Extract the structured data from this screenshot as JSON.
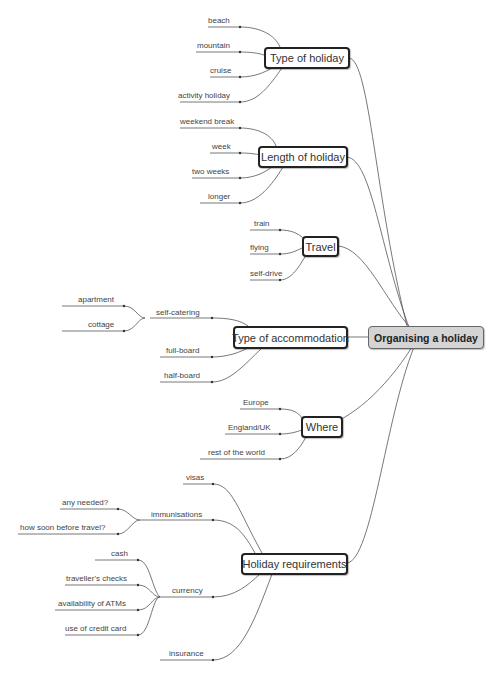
{
  "root": {
    "label": "Organising a holiday"
  },
  "branches": [
    {
      "label": "Type of holiday",
      "children": [
        "beach",
        "mountain",
        "cruise",
        "activity holiday"
      ]
    },
    {
      "label": "Length of holiday",
      "children": [
        "weekend break",
        "week",
        "two weeks",
        "longer"
      ]
    },
    {
      "label": "Travel",
      "children": [
        "train",
        "flying",
        "self-drive"
      ]
    },
    {
      "label": "Type of accommodation",
      "children": [
        {
          "label": "self-catering",
          "children": [
            "apartment",
            "cottage"
          ]
        },
        "full-board",
        "half-board"
      ]
    },
    {
      "label": "Where",
      "children": [
        "Europe",
        "England/UK",
        "rest of the world"
      ]
    },
    {
      "label": "Holiday requirements",
      "children": [
        "visas",
        {
          "label": "immunisations",
          "children": [
            "any needed?",
            "how soon before travel?"
          ]
        },
        {
          "label": "currency",
          "children": [
            "cash",
            "traveller's checks",
            "availability of ATMs",
            "use of credit card"
          ]
        },
        "insurance"
      ]
    }
  ],
  "labels": {
    "b0": "Type of holiday",
    "b0c0": "beach",
    "b0c1": "mountain",
    "b0c2": "cruise",
    "b0c3": "activity holiday",
    "b1": "Length of holiday",
    "b1c0": "weekend break",
    "b1c1": "week",
    "b1c2": "two weeks",
    "b1c3": "longer",
    "b2": "Travel",
    "b2c0": "train",
    "b2c1": "flying",
    "b2c2": "self-drive",
    "b3": "Type of accommodation",
    "b3c0": "self-catering",
    "b3c0a": "apartment",
    "b3c0b": "cottage",
    "b3c1": "full-board",
    "b3c2": "half-board",
    "b4": "Where",
    "b4c0": "Europe",
    "b4c1": "England/UK",
    "b4c2": "rest of the world",
    "b5": "Holiday requirements",
    "b5c0": "visas",
    "b5c1": "immunisations",
    "b5c1a": "any needed?",
    "b5c1b": "how soon before travel?",
    "b5c2": "currency",
    "b5c2a": "cash",
    "b5c2b": "traveller's checks",
    "b5c2c": "availability of ATMs",
    "b5c2d": "use of credit card",
    "b5c3": "insurance"
  },
  "colors": {
    "root_fill": "#d4d4d4",
    "node_border": "#222222",
    "line": "#555555",
    "text": "#333333"
  }
}
